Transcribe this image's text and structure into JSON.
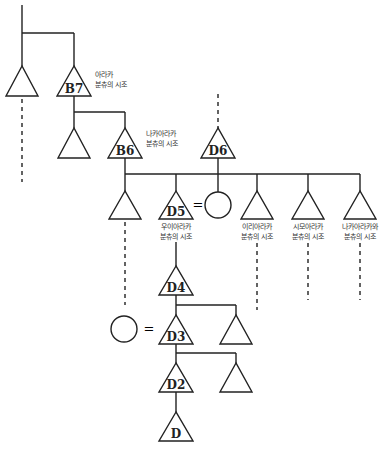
{
  "diagram": {
    "type": "kinship-genealogy",
    "nodes": {
      "b7": {
        "label": "B7",
        "annotation": [
          "아라카",
          "분츄의 시조"
        ]
      },
      "b6": {
        "label": "B6",
        "annotation": [
          "나카아라카",
          "분츄의 시조"
        ]
      },
      "d6": {
        "label": "D6"
      },
      "d5": {
        "label": "D5",
        "annotation": [
          "우이아라카",
          "분츄의 시조"
        ]
      },
      "sib_iri": {
        "label": "",
        "annotation": [
          "이리아라카",
          "분츄의 시조"
        ]
      },
      "sib_shimo": {
        "label": "",
        "annotation": [
          "시모아라카",
          "분츄의 시조"
        ]
      },
      "sib_nakawa": {
        "label": "",
        "annotation": [
          "나카아라카와",
          "분츄의 시조"
        ]
      },
      "d4": {
        "label": "D4"
      },
      "d3": {
        "label": "D3"
      },
      "d2": {
        "label": "D2"
      },
      "d": {
        "label": "D"
      }
    },
    "marriage_symbol": "=",
    "legend": {
      "triangle": "male",
      "circle": "female",
      "equals": "marriage",
      "dashed_line": "continued lineage"
    }
  }
}
